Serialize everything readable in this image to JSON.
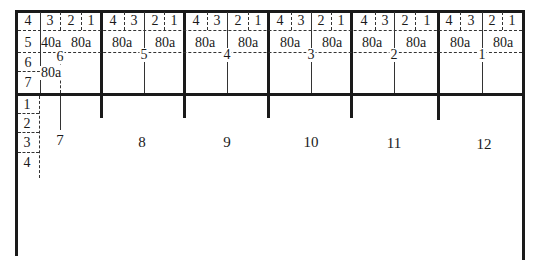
{
  "diagram": {
    "title": "",
    "sections": [
      {
        "id": "section-6",
        "center_label": "6",
        "header": [
          "4",
          "3",
          "2",
          "1"
        ],
        "row_labels": [
          "5",
          "6",
          "7"
        ],
        "values": [
          "40a",
          "80a"
        ]
      },
      {
        "id": "section-5",
        "center_label": "5",
        "header": [
          "4",
          "3",
          "2",
          "1"
        ],
        "values": [
          "80a",
          "80a"
        ]
      },
      {
        "id": "section-4",
        "center_label": "4",
        "header": [
          "4",
          "3",
          "2",
          "1"
        ],
        "values": [
          "80a",
          "80a"
        ]
      },
      {
        "id": "section-3",
        "center_label": "3",
        "header": [
          "4",
          "3",
          "2",
          "1"
        ],
        "values": [
          "80a",
          "80a"
        ]
      },
      {
        "id": "section-2",
        "center_label": "2",
        "header": [
          "4",
          "3",
          "2",
          "1"
        ],
        "values": [
          "80a",
          "80a"
        ]
      },
      {
        "id": "section-1",
        "center_label": "1",
        "header": [
          "4",
          "3",
          "2",
          "1"
        ],
        "values": [
          "80a",
          "80a"
        ]
      }
    ],
    "lower_left_rows": [
      "1",
      "2",
      "3",
      "4"
    ],
    "lower_columns": [
      "7",
      "8",
      "9",
      "10",
      "11",
      "12"
    ]
  }
}
